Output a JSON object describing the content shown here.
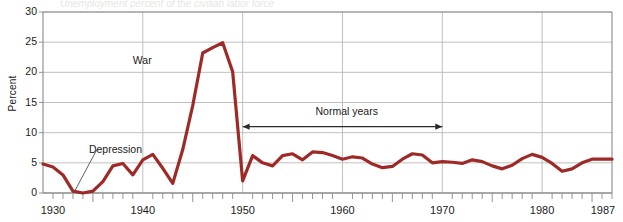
{
  "figure": {
    "partial_title": "Unemployment percent of the civilian labor force",
    "ylabel": "Percent",
    "annotations": {
      "depression": "Depression",
      "war": "War",
      "normal_years": "Normal years"
    },
    "line_color": "#9e2a28",
    "grid_color": "#b9b9b9",
    "axis_color": "#8a8a8a"
  },
  "chart_data": {
    "type": "line",
    "title": "Unemployment percent of the civilian labor force",
    "xlabel": "",
    "ylabel": "Percent",
    "xlim": [
      1930,
      1987
    ],
    "ylim": [
      0,
      30
    ],
    "yticks": [
      0,
      5,
      10,
      15,
      20,
      25,
      30
    ],
    "xticks": [
      1930,
      1940,
      1950,
      1960,
      1970,
      1980,
      1987
    ],
    "xtick_labels": [
      "1930",
      "1940",
      "1950",
      "1960",
      "1970",
      "1980",
      "1987"
    ],
    "grid": true,
    "legend": "none",
    "annotations": [
      {
        "text": "Depression",
        "x": 1934,
        "y": 1.5,
        "leader": true
      },
      {
        "text": "War",
        "x": 1941,
        "y": 22
      },
      {
        "text": "Normal years",
        "x": 1959,
        "y": 12,
        "arrow_span": [
          1950,
          1970
        ]
      }
    ],
    "series": [
      {
        "name": "Unemployment rate",
        "color": "#9e2a28",
        "x": [
          1930,
          1931,
          1932,
          1933,
          1934,
          1935,
          1936,
          1937,
          1938,
          1939,
          1940,
          1941,
          1942,
          1943,
          1944,
          1945,
          1946,
          1947,
          1948,
          1949,
          1950,
          1951,
          1952,
          1953,
          1954,
          1955,
          1956,
          1957,
          1958,
          1959,
          1960,
          1961,
          1962,
          1963,
          1964,
          1965,
          1966,
          1967,
          1968,
          1969,
          1970,
          1971,
          1972,
          1973,
          1974,
          1975,
          1976,
          1977,
          1978,
          1979,
          1980,
          1981,
          1982,
          1983,
          1984,
          1985,
          1986,
          1987
        ],
        "values": [
          4.8,
          4.3,
          3.0,
          0.3,
          0.0,
          0.3,
          1.9,
          4.5,
          4.9,
          3.0,
          5.5,
          6.4,
          4.1,
          1.6,
          7.2,
          14.5,
          23.2,
          24.1,
          24.9,
          20.1,
          2.0,
          6.2,
          5.0,
          4.5,
          6.2,
          6.5,
          5.5,
          6.8,
          6.7,
          6.2,
          5.6,
          6.0,
          5.8,
          4.8,
          4.2,
          4.4,
          5.6,
          6.5,
          6.3,
          5.0,
          5.2,
          5.1,
          4.9,
          5.5,
          5.2,
          4.5,
          4.0,
          4.6,
          5.7,
          6.4,
          5.9,
          4.9,
          3.6,
          4.0,
          5.0,
          5.6,
          5.6,
          5.6
        ]
      }
    ]
  }
}
